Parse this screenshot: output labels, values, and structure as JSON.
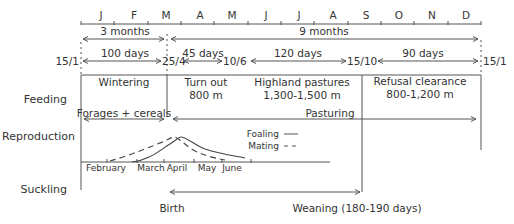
{
  "months": [
    "J",
    "F",
    "M",
    "A",
    "M",
    "J",
    "J",
    "A",
    "S",
    "O",
    "N",
    "D"
  ],
  "periods": {
    "winter_span": "3 months",
    "summer_span": "9 months"
  },
  "dates": {
    "start": "15/1",
    "d1": "25/4",
    "d2": "10/6",
    "d3": "15/10",
    "end": "15/1"
  },
  "durations": {
    "p1": "100 days",
    "p2": "45 days",
    "p3": "120 days",
    "p4": "90 days"
  },
  "rows": {
    "feeding": "Feeding",
    "reproduction": "Reproduction",
    "suckling": "Suckling"
  },
  "feeding": {
    "wintering": "Wintering",
    "turnout": "Turn out",
    "turnout_alt": "800 m",
    "highland": "Highland pastures",
    "highland_alt": "1,300-1,500 m",
    "refusal": "Refusal clearance",
    "refusal_alt": "800-1,200 m",
    "forages": "Forages + cereals",
    "pasturing": "Pasturing"
  },
  "reproduction": {
    "legend_foaling": "Foaling",
    "legend_mating": "Mating",
    "axis_months": [
      "February",
      "March",
      "April",
      "May",
      "June"
    ]
  },
  "suckling": {
    "birth": "Birth",
    "weaning": "Weaning (180-190 days)"
  }
}
